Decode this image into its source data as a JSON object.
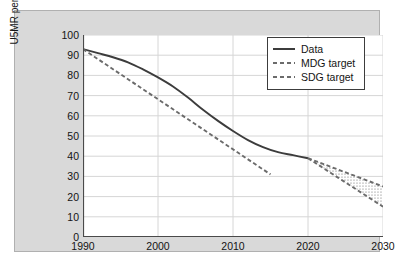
{
  "chart_data": {
    "type": "line",
    "title": "",
    "xlabel": "",
    "ylabel": "U5MR per 1,000 Live Births",
    "xlim": [
      1990,
      2030
    ],
    "ylim": [
      0,
      100
    ],
    "xticks": [
      1990,
      2000,
      2010,
      2020,
      2030
    ],
    "xtick_labels": [
      "1990",
      "2000",
      "2010",
      "2020",
      "2030"
    ],
    "x_minor_step": 2,
    "yticks": [
      0,
      10,
      20,
      30,
      40,
      50,
      60,
      70,
      80,
      90,
      100
    ],
    "ytick_labels": [
      "0",
      "10",
      "20",
      "30",
      "40",
      "50",
      "60",
      "70",
      "80",
      "90",
      "100"
    ],
    "grid": true,
    "legend_position": "upper right",
    "series": [
      {
        "name": "Data",
        "style": "solid",
        "color": "#3c3c3c",
        "x": [
          1990,
          1992,
          1994,
          1996,
          1998,
          2000,
          2002,
          2004,
          2006,
          2008,
          2010,
          2012,
          2014,
          2016,
          2018,
          2020
        ],
        "values": [
          93,
          91,
          89,
          86.5,
          83,
          79,
          74.5,
          69,
          63,
          57.5,
          52.5,
          48,
          44.5,
          42,
          40.5,
          39
        ]
      },
      {
        "name": "MDG target",
        "style": "dashed",
        "color": "#6b6b6b",
        "x": [
          1990,
          1995,
          2000,
          2005,
          2010,
          2015
        ],
        "values": [
          93,
          80.6,
          68.2,
          55.8,
          43.4,
          31
        ]
      },
      {
        "name": "SDG target",
        "style": "dashed",
        "color": "#6b6b6b",
        "x": [
          2020,
          2022,
          2024,
          2026,
          2028,
          2030
        ],
        "values": [
          39,
          36.2,
          33.4,
          30.6,
          27.8,
          25
        ]
      },
      {
        "name": "SDG target lower bound",
        "style": "dashed",
        "color": "#6b6b6b",
        "x": [
          2020,
          2022,
          2024,
          2026,
          2028,
          2030
        ],
        "values": [
          39,
          34.2,
          29.4,
          24.6,
          19.8,
          15
        ]
      }
    ],
    "shaded_band": {
      "description": "stippled wedge between SDG target upper and lower bounds",
      "x": [
        2020,
        2030
      ],
      "upper": [
        39,
        25
      ],
      "lower": [
        39,
        15
      ]
    }
  },
  "legend": {
    "items": [
      {
        "label": "Data",
        "style": "solid"
      },
      {
        "label": "MDG target",
        "style": "dashed"
      },
      {
        "label": "SDG target",
        "style": "dashed"
      }
    ]
  }
}
